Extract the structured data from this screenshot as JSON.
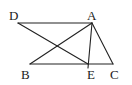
{
  "diagram": {
    "type": "geometry",
    "stroke_color": "#222222",
    "background": "#ffffff",
    "points": [
      {
        "name": "D",
        "x": 18,
        "y": 23,
        "label": "D",
        "label_x": 9,
        "label_y": 20
      },
      {
        "name": "A",
        "x": 92,
        "y": 23,
        "label": "A",
        "label_x": 87,
        "label_y": 20
      },
      {
        "name": "B",
        "x": 30,
        "y": 64,
        "label": "B",
        "label_x": 21,
        "label_y": 79
      },
      {
        "name": "E",
        "x": 88,
        "y": 66,
        "label": "E",
        "label_x": 87,
        "label_y": 79
      },
      {
        "name": "C",
        "x": 113,
        "y": 64,
        "label": "C",
        "label_x": 110,
        "label_y": 79
      }
    ],
    "segments": [
      {
        "from": "D",
        "to": "A"
      },
      {
        "from": "D",
        "to": "E"
      },
      {
        "from": "A",
        "to": "B"
      },
      {
        "from": "A",
        "to": "E"
      },
      {
        "from": "A",
        "to": "C"
      },
      {
        "from": "B",
        "to": "C"
      }
    ]
  }
}
